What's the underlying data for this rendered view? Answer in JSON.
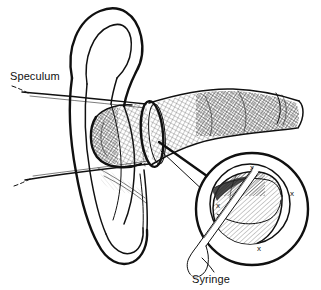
{
  "figure": {
    "style": "pen-and-ink line drawing",
    "background_color": "#ffffff",
    "ink_color": "#101010",
    "width": 321,
    "height": 290
  },
  "labels": {
    "speculum": {
      "text": "Speculum",
      "x": 10,
      "y": 80
    },
    "syringe": {
      "text": "Syringe",
      "x": 192,
      "y": 283
    }
  },
  "inset": {
    "name": "magnified-speculum-view",
    "center_x": 252,
    "center_y": 209,
    "outer_radius": 56,
    "inner_radius": 41,
    "marks": [
      {
        "text": "x",
        "x": 252,
        "y": 170
      },
      {
        "text": "x",
        "x": 218,
        "y": 208
      },
      {
        "text": "x",
        "x": 292,
        "y": 196
      },
      {
        "text": "x",
        "x": 259,
        "y": 251
      }
    ]
  },
  "parts": {
    "auricle": "external ear (pinna)",
    "ear_canal": "external auditory canal",
    "speculum_ring": "aural speculum rim",
    "tympanic_membrane": "eardrum",
    "needle": "irrigation syringe tip"
  }
}
